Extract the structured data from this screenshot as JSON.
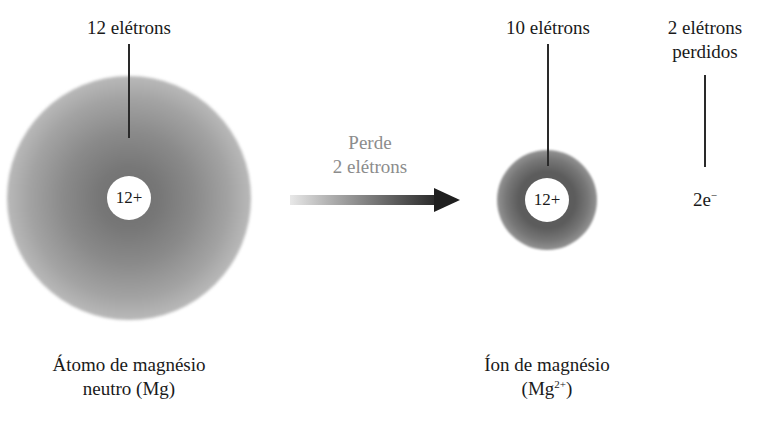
{
  "neutral_atom": {
    "electron_label": "12 elétrons",
    "nucleus_charge": "12+",
    "caption_line1": "Átomo de magnésio",
    "caption_line2": "neutro (Mg)"
  },
  "process": {
    "label_line1": "Perde",
    "label_line2": "2 elétrons"
  },
  "ion": {
    "electron_label": "10 elétrons",
    "nucleus_charge": "12+",
    "caption_line1": "Íon de magnésio",
    "caption_line2_prefix": "(Mg",
    "caption_line2_sup": "2+",
    "caption_line2_suffix": ")"
  },
  "lost_electrons": {
    "label_line1": "2 elétrons",
    "label_line2": "perdidos",
    "symbol_base": "2e",
    "symbol_sup": "−"
  },
  "colors": {
    "cloud_dark": "#5c5c5c",
    "arrow_dark": "#1f1f1f",
    "process_text": "#8c8c8c",
    "text": "#1a1a1a"
  }
}
